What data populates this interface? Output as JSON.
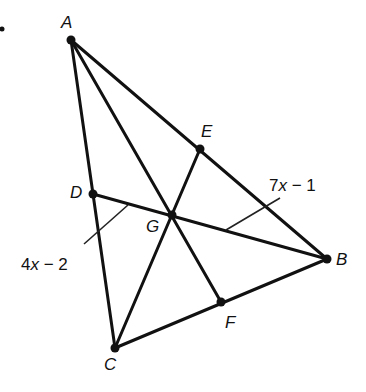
{
  "problem_bullet": "•",
  "diagram": {
    "type": "triangle-centroid",
    "points": {
      "A": {
        "label": "A",
        "x": 71,
        "y": 40
      },
      "B": {
        "label": "B",
        "x": 327,
        "y": 259
      },
      "C": {
        "label": "C",
        "x": 115,
        "y": 348
      },
      "D": {
        "label": "D",
        "x": 93,
        "y": 194
      },
      "E": {
        "label": "E",
        "x": 200,
        "y": 149
      },
      "F": {
        "label": "F",
        "x": 221,
        "y": 302
      },
      "G": {
        "label": "G",
        "x": 172,
        "y": 215
      }
    },
    "segments": [
      [
        "A",
        "B"
      ],
      [
        "B",
        "C"
      ],
      [
        "C",
        "A"
      ],
      [
        "A",
        "F"
      ],
      [
        "B",
        "D"
      ],
      [
        "C",
        "E"
      ]
    ],
    "annotations": {
      "DG": {
        "text_num": "4",
        "text_var": "x",
        "text_rest": " − 2"
      },
      "GB": {
        "text_num": "7",
        "text_var": "x",
        "text_rest": " − 1"
      }
    },
    "line_color": "#111111"
  }
}
